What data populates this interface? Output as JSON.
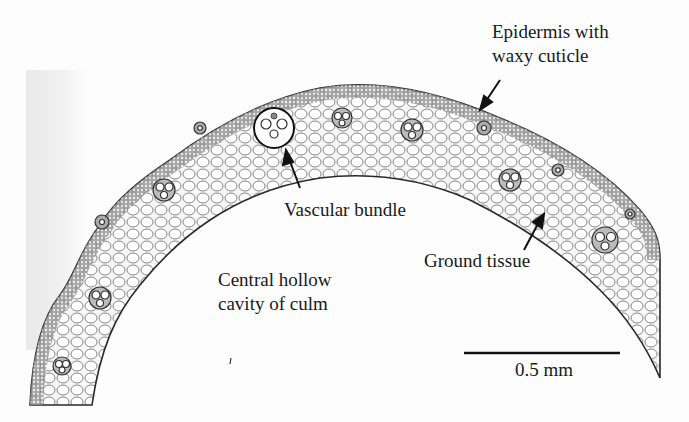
{
  "figure": {
    "labels": {
      "epidermis": [
        "Epidermis with",
        "waxy cuticle"
      ],
      "vascular_bundle": "Vascular bundle",
      "ground_tissue": "Ground tissue",
      "central_cavity": [
        "Central hollow",
        "cavity of culm"
      ]
    },
    "scale_bar": {
      "label": "0.5 mm"
    },
    "colors": {
      "ink": "#1a1a1a",
      "tissue_fill": "#f4f4f4",
      "sclerenchyma": "#6a6a6a",
      "background": "#fdfdfd"
    }
  }
}
